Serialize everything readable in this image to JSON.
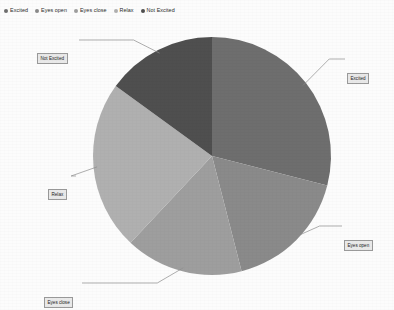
{
  "legend": {
    "items": [
      {
        "label": "Excited",
        "color": "#6e6e6e",
        "icon": "legend-dot-icon"
      },
      {
        "label": "Eyes open",
        "color": "#8a8a8a",
        "icon": "legend-dot-icon"
      },
      {
        "label": "Eyes close",
        "color": "#9e9e9e",
        "icon": "legend-dot-icon"
      },
      {
        "label": "Relax",
        "color": "#b0b0b0",
        "icon": "legend-dot-icon"
      },
      {
        "label": "Not Excited",
        "color": "#4f4f4f",
        "icon": "legend-dot-icon"
      }
    ]
  },
  "callouts": {
    "excited": "Excited",
    "eyes_open": "Eyes open",
    "eyes_close": "Eyes close",
    "relax": "Relax",
    "not_excited": "Not Excited"
  },
  "chart_data": {
    "type": "pie",
    "title": "",
    "labels": [
      "Excited",
      "Eyes open",
      "Eyes close",
      "Relax",
      "Not Excited"
    ],
    "values": [
      29,
      17,
      16,
      23,
      15
    ],
    "colors": [
      "#6e6e6e",
      "#8a8a8a",
      "#9e9e9e",
      "#b0b0b0",
      "#4f4f4f"
    ],
    "legend_position": "top-left",
    "grid": false,
    "start_angle_deg": 0,
    "direction": "clockwise",
    "center": {
      "x": 212,
      "y": 156
    },
    "radius": 119,
    "labels_outside": true
  }
}
